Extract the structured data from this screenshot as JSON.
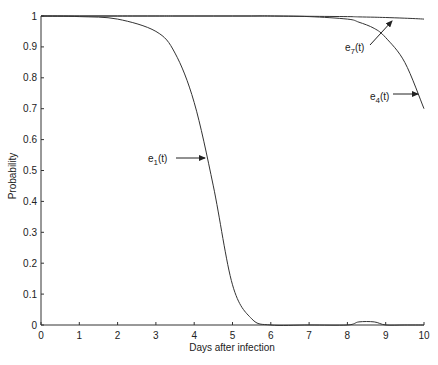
{
  "chart_data": {
    "type": "line",
    "title": "",
    "xlabel": "Days after infection",
    "ylabel": "Probability",
    "xlim": [
      0,
      10
    ],
    "ylim": [
      0,
      1
    ],
    "grid": false,
    "legend": "none (inline arrow annotations)",
    "x_ticks": [
      0,
      1,
      2,
      3,
      4,
      5,
      6,
      7,
      8,
      9,
      10
    ],
    "x_tick_labels": [
      "0",
      "1",
      "2",
      "3",
      "4",
      "5",
      "6",
      "7",
      "8",
      "9",
      "10"
    ],
    "y_ticks": [
      0,
      0.1,
      0.2,
      0.3,
      0.4,
      0.5,
      0.6,
      0.7,
      0.8,
      0.9,
      1
    ],
    "y_tick_labels": [
      "0",
      "0.1",
      "0.2",
      "0.3",
      "0.4",
      "0.5",
      "0.6",
      "0.7",
      "0.8",
      "0.9",
      "1"
    ],
    "x": [
      0,
      1,
      2,
      3,
      3.5,
      4,
      4.5,
      5,
      5.5,
      6,
      7,
      8,
      8.3,
      8.7,
      9,
      9.5,
      10
    ],
    "series": [
      {
        "name": "e1(t)",
        "values": [
          1.0,
          0.998,
          0.99,
          0.95,
          0.88,
          0.72,
          0.45,
          0.13,
          0.02,
          0.0,
          0.0,
          0.0,
          0.01,
          0.01,
          0.0,
          0.0,
          0.0
        ]
      },
      {
        "name": "e4(t)",
        "values": [
          1.0,
          1.0,
          1.0,
          1.0,
          1.0,
          1.0,
          1.0,
          1.0,
          1.0,
          1.0,
          0.998,
          0.99,
          0.98,
          0.96,
          0.93,
          0.85,
          0.7
        ]
      },
      {
        "name": "e7(t)",
        "values": [
          1.0,
          1.0,
          1.0,
          1.0,
          1.0,
          1.0,
          1.0,
          1.0,
          1.0,
          1.0,
          0.999,
          0.998,
          0.997,
          0.996,
          0.995,
          0.993,
          0.99
        ]
      }
    ],
    "annotations": [
      {
        "label_main": "e",
        "label_sub": "1",
        "label_tail": "(t)",
        "series": "e1(t)",
        "at_x": 4.3
      },
      {
        "label_main": "e",
        "label_sub": "7",
        "label_tail": "(t)",
        "series": "e7(t)",
        "at_x": 9.2
      },
      {
        "label_main": "e",
        "label_sub": "4",
        "label_tail": "(t)",
        "series": "e4(t)",
        "at_x": 9.8
      }
    ]
  }
}
